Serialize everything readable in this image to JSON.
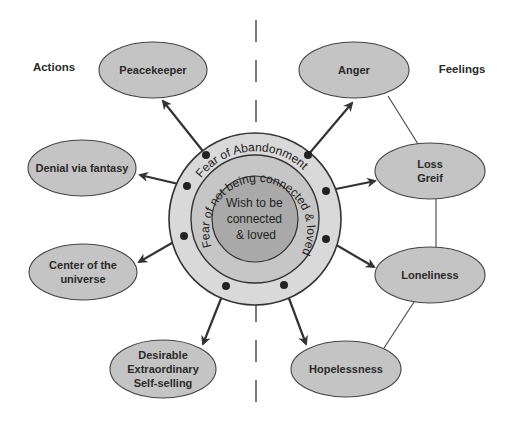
{
  "side_labels": {
    "left": "Actions",
    "right": "Feelings"
  },
  "center": {
    "inner_lines": [
      "Wish to be",
      "connected",
      "& loved"
    ],
    "middle_ring_text": "Fear of not being connected & loved",
    "outer_ring_text": "Fear of Abandonment"
  },
  "actions": [
    {
      "id": "peacekeeper",
      "lines": [
        "Peacekeeper"
      ]
    },
    {
      "id": "denial",
      "lines": [
        "Denial via fantasy"
      ]
    },
    {
      "id": "center-universe",
      "lines": [
        "Center of the",
        "universe"
      ]
    },
    {
      "id": "desirable",
      "lines": [
        "Desirable",
        "Extraordinary",
        "Self-selling"
      ]
    }
  ],
  "feelings": [
    {
      "id": "anger",
      "lines": [
        "Anger"
      ]
    },
    {
      "id": "loss-greif",
      "lines": [
        "Loss",
        "Greif"
      ]
    },
    {
      "id": "loneliness",
      "lines": [
        "Loneliness"
      ]
    },
    {
      "id": "hopelessness",
      "lines": [
        "Hopelessness"
      ]
    }
  ],
  "feeling_links": [
    [
      "anger",
      "loss-greif"
    ],
    [
      "loss-greif",
      "loneliness"
    ],
    [
      "loneliness",
      "hopelessness"
    ]
  ],
  "colors": {
    "ellipse_fill": "#c4c4c4",
    "outer_ring": "#d9d9d9",
    "middle_ring": "#c6c6c6",
    "inner_circle": "#a9a9a9",
    "stroke": "#333333"
  }
}
